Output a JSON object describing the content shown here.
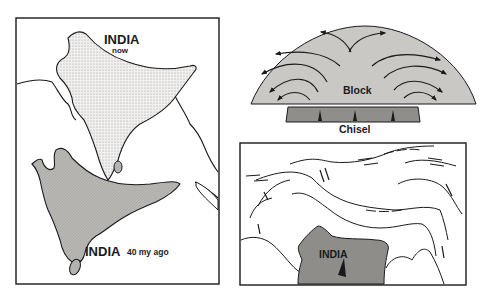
{
  "panels": {
    "india_drift": {
      "label_now_title": "INDIA",
      "label_now_sub": "now",
      "label_past_title": "INDIA",
      "label_past_sub": "40 my ago"
    },
    "block_chisel": {
      "block_label": "Block",
      "chisel_label": "Chisel"
    },
    "indentation_map": {
      "india_label": "INDIA"
    }
  },
  "colors": {
    "stroke": "#1a1a1a",
    "india_now_fill": "#ecebe8",
    "india_past_fill": "#b9b8b5",
    "block_fill": "#c9c8c5",
    "chisel_fill": "#8f8e8b",
    "india_map_fill": "#8e8d8a"
  }
}
